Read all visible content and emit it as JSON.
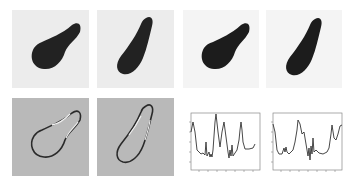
{
  "figure": {
    "rows": 2,
    "cols": 4,
    "panels": [
      {
        "id": "a",
        "row": 0,
        "col": 0,
        "kind": "binary-shape",
        "description": "noisy image of pear-shaped blob"
      },
      {
        "id": "b",
        "row": 0,
        "col": 1,
        "kind": "binary-shape",
        "description": "noisy image of elongated tilted blob"
      },
      {
        "id": "c",
        "row": 0,
        "col": 2,
        "kind": "binary-shape",
        "description": "segmented pear-shaped blob"
      },
      {
        "id": "d",
        "row": 0,
        "col": 3,
        "kind": "binary-shape",
        "description": "segmented elongated blob"
      },
      {
        "id": "e",
        "row": 1,
        "col": 0,
        "kind": "contour-edge",
        "description": "edge map of pear-shaped contour on gray"
      },
      {
        "id": "f",
        "row": 1,
        "col": 1,
        "kind": "contour-edge",
        "description": "edge map of elongated contour on gray"
      },
      {
        "id": "g",
        "row": 1,
        "col": 2,
        "kind": "line-plot",
        "description": "curvature/signature plot for shape 1"
      },
      {
        "id": "h",
        "row": 1,
        "col": 3,
        "kind": "line-plot",
        "description": "curvature/signature plot for shape 2"
      }
    ],
    "colors": {
      "shape_fill": "#222222",
      "noise_background": "#ececec",
      "edge_background": "#b9b9b9",
      "plot_line": "#333333",
      "axis": "#555555"
    }
  }
}
